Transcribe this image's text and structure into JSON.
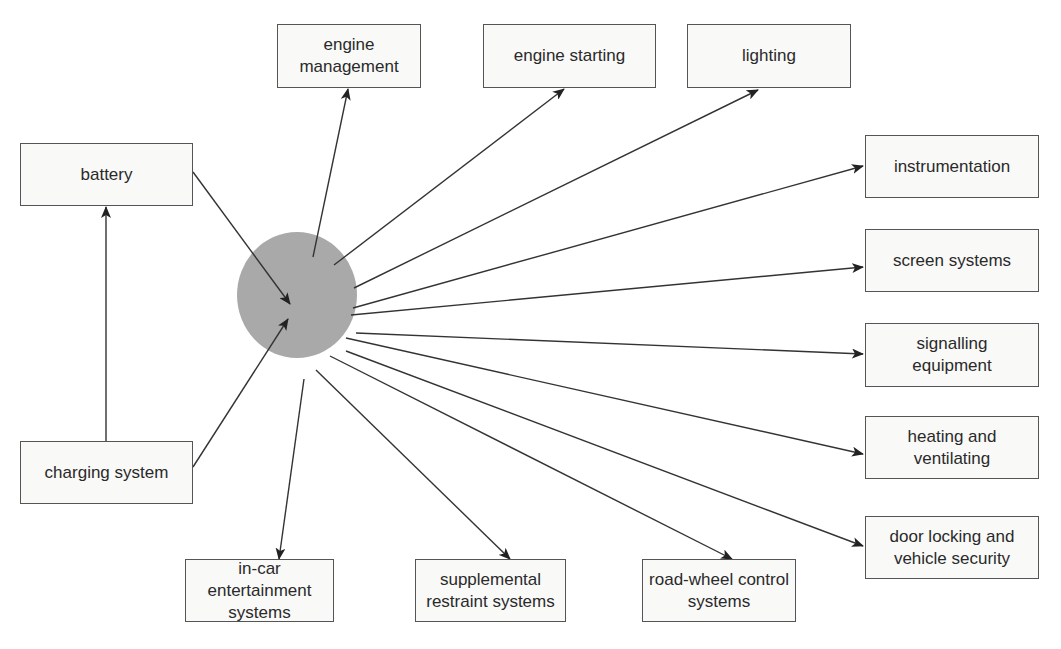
{
  "diagram": {
    "hub": {
      "label": "",
      "fill": "#a9a9a9"
    },
    "inputs": [
      {
        "id": "battery",
        "label": "battery"
      },
      {
        "id": "charging",
        "label": "charging system"
      }
    ],
    "outputs": [
      {
        "id": "engine_management",
        "label": "engine management"
      },
      {
        "id": "engine_starting",
        "label": "engine starting"
      },
      {
        "id": "lighting",
        "label": "lighting"
      },
      {
        "id": "instrumentation",
        "label": "instrumentation"
      },
      {
        "id": "screen_systems",
        "label": "screen systems"
      },
      {
        "id": "signalling",
        "label": "signalling equipment"
      },
      {
        "id": "heating",
        "label": "heating and ventilating"
      },
      {
        "id": "door_locking",
        "label": "door locking and vehicle security"
      },
      {
        "id": "in_car",
        "label": "in-car entertainment systems"
      },
      {
        "id": "srs",
        "label": "supplemental restraint systems"
      },
      {
        "id": "road_wheel",
        "label": "road-wheel control systems"
      }
    ],
    "edges": [
      {
        "from": "charging",
        "to": "battery"
      },
      {
        "from": "battery",
        "to": "hub"
      },
      {
        "from": "charging",
        "to": "hub"
      },
      {
        "from": "hub",
        "to": "engine_management"
      },
      {
        "from": "hub",
        "to": "engine_starting"
      },
      {
        "from": "hub",
        "to": "lighting"
      },
      {
        "from": "hub",
        "to": "instrumentation"
      },
      {
        "from": "hub",
        "to": "screen_systems"
      },
      {
        "from": "hub",
        "to": "signalling"
      },
      {
        "from": "hub",
        "to": "heating"
      },
      {
        "from": "hub",
        "to": "door_locking"
      },
      {
        "from": "hub",
        "to": "in_car"
      },
      {
        "from": "hub",
        "to": "srs"
      },
      {
        "from": "hub",
        "to": "road_wheel"
      }
    ],
    "colors": {
      "line": "#333333",
      "box_border": "#555555",
      "box_fill": "#f9f9f8",
      "hub": "#a9a9a9"
    }
  }
}
